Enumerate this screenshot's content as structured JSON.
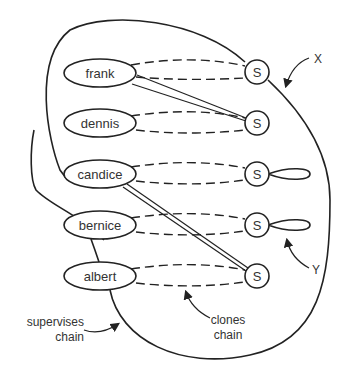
{
  "diagram": {
    "processes": [
      {
        "name": "frank"
      },
      {
        "name": "dennis"
      },
      {
        "name": "candice"
      },
      {
        "name": "bernice"
      },
      {
        "name": "albert"
      }
    ],
    "signal_label": "S",
    "signal_count": 5,
    "annotations": {
      "x": "X",
      "y": "Y",
      "supervises_line1": "supervises",
      "supervises_line2": "chain",
      "clones_line1": "clones",
      "clones_line2": "chain"
    }
  }
}
